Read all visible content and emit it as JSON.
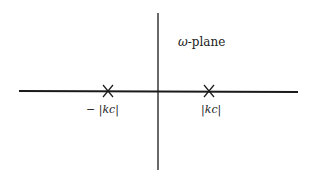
{
  "diagram": {
    "plane_label": "ω-plane",
    "plane_symbol": "ω",
    "plane_suffix": "-plane",
    "points": [
      {
        "label_prefix": "− ",
        "label_body": "kc",
        "marker": "x-mark-icon"
      },
      {
        "label_prefix": "",
        "label_body": "kc",
        "marker": "x-mark-icon"
      }
    ],
    "colors": {
      "axis": "#1a1a1a",
      "background": "#ffffff"
    }
  }
}
